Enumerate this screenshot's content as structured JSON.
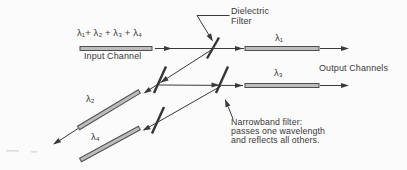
{
  "diagram_title": "wdm-demultiplexer",
  "input": {
    "wavelengths": "λ₁+ λ₂ + λ₃ + λ₄",
    "channel_label": "Input Channel"
  },
  "output": {
    "channels_label": "Output Channels"
  },
  "filters": {
    "dielectric_label": "Dielectric\nFilter",
    "narrowband_note": "Narrowband filter:\npasses one wavelength\nand reflects all others."
  },
  "channels": {
    "l1": "λ₁",
    "l2": "λ₂",
    "l3": "λ₃",
    "l4": "λ₄"
  },
  "colors": {
    "line": "#3a3a3a",
    "fiber_fill": "#bdbdbd",
    "fiber_stroke": "#4f4f4f",
    "text": "#3a3a3a",
    "background": "#fbfbfb"
  }
}
